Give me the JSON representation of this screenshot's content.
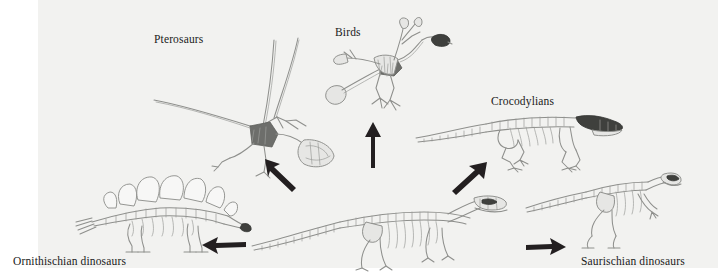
{
  "figure": {
    "type": "phylogeny-diagram",
    "background_color": "#ffffff",
    "panel_color": "#f2f2f0",
    "label_color": "#1a1a1a",
    "arrow_color": "#231f20",
    "bone_color": "#8e8f8c"
  },
  "labels": [
    {
      "id": "pterosaurs",
      "text": "Pterosaurs",
      "x": 154,
      "y": 33
    },
    {
      "id": "birds",
      "text": "Birds",
      "x": 335,
      "y": 26
    },
    {
      "id": "crocodylians",
      "text": "Crocodylians",
      "x": 491,
      "y": 95
    },
    {
      "id": "ornithischian-dinosaurs",
      "text": "Ornithischian dinosaurs",
      "x": 13,
      "y": 255
    },
    {
      "id": "saurischian-dinosaurs",
      "text": "Saurischian dinosaurs",
      "x": 581,
      "y": 255
    }
  ],
  "organisms": [
    {
      "id": "pterosaur-skeleton",
      "name": "Pterosaurs",
      "label_ref": "pterosaurs"
    },
    {
      "id": "bird-skeleton",
      "name": "Birds",
      "label_ref": "birds"
    },
    {
      "id": "crocodylian-skeleton",
      "name": "Crocodylians",
      "label_ref": "crocodylians"
    },
    {
      "id": "stegosaur-skeleton",
      "name": "Ornithischian dinosaurs",
      "label_ref": "ornithischian-dinosaurs"
    },
    {
      "id": "theropod-skeleton",
      "name": "Saurischian dinosaurs",
      "label_ref": "saurischian-dinosaurs"
    },
    {
      "id": "basal-archosaur-skeleton",
      "name": "Ancestral archosaur",
      "label_ref": null
    }
  ],
  "arrows": [
    {
      "id": "arrow-to-pterosaurs",
      "direction": "up-left",
      "from": "basal-archosaur-skeleton",
      "to": "pterosaur-skeleton"
    },
    {
      "id": "arrow-to-birds",
      "direction": "up",
      "from": "basal-archosaur-skeleton",
      "to": "bird-skeleton"
    },
    {
      "id": "arrow-to-crocodylians",
      "direction": "up-right",
      "from": "basal-archosaur-skeleton",
      "to": "crocodylian-skeleton"
    },
    {
      "id": "arrow-to-ornithischians",
      "direction": "left",
      "from": "basal-archosaur-skeleton",
      "to": "stegosaur-skeleton"
    },
    {
      "id": "arrow-to-saurischians",
      "direction": "right",
      "from": "basal-archosaur-skeleton",
      "to": "theropod-skeleton"
    }
  ]
}
